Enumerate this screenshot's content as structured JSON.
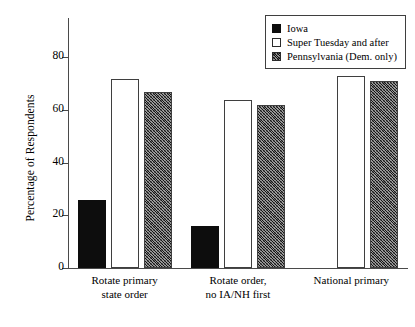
{
  "chart_data": {
    "type": "bar",
    "title": "",
    "xlabel": "",
    "ylabel": "Percentage of Respondents",
    "ylim": [
      0,
      95
    ],
    "yticks": [
      0,
      20,
      40,
      60,
      80
    ],
    "ytick_labels": [
      "0",
      "20",
      "40",
      "60",
      "80"
    ],
    "grid": false,
    "legend_position": "top-right",
    "categories": [
      "Rotate primary\nstate order",
      "Rotate order,\nno IA/NH first",
      "National primary"
    ],
    "series": [
      {
        "name": "Iowa",
        "values": [
          26,
          16,
          null
        ],
        "swatch": "solid-black",
        "color": "#0d0d0d"
      },
      {
        "name": "Super Tuesday and after",
        "values": [
          72,
          64,
          73
        ],
        "swatch": "open-white",
        "color": "#ffffff"
      },
      {
        "name": "Pennsylvania (Dem. only)",
        "values": [
          67,
          62,
          71
        ],
        "swatch": "hatched-gray",
        "color": "#8f8f8f"
      }
    ]
  },
  "legend": {
    "items": [
      {
        "label": "Iowa"
      },
      {
        "label": "Super Tuesday and after"
      },
      {
        "label": "Pennsylvania (Dem. only)"
      }
    ]
  },
  "axis": {
    "y_title": "Percentage of Respondents",
    "y_tick_labels": [
      "80",
      "60",
      "40",
      "20",
      "0"
    ]
  },
  "x_labels": [
    "Rotate primary\nstate order",
    "Rotate order,\nno IA/NH first",
    "National primary"
  ]
}
